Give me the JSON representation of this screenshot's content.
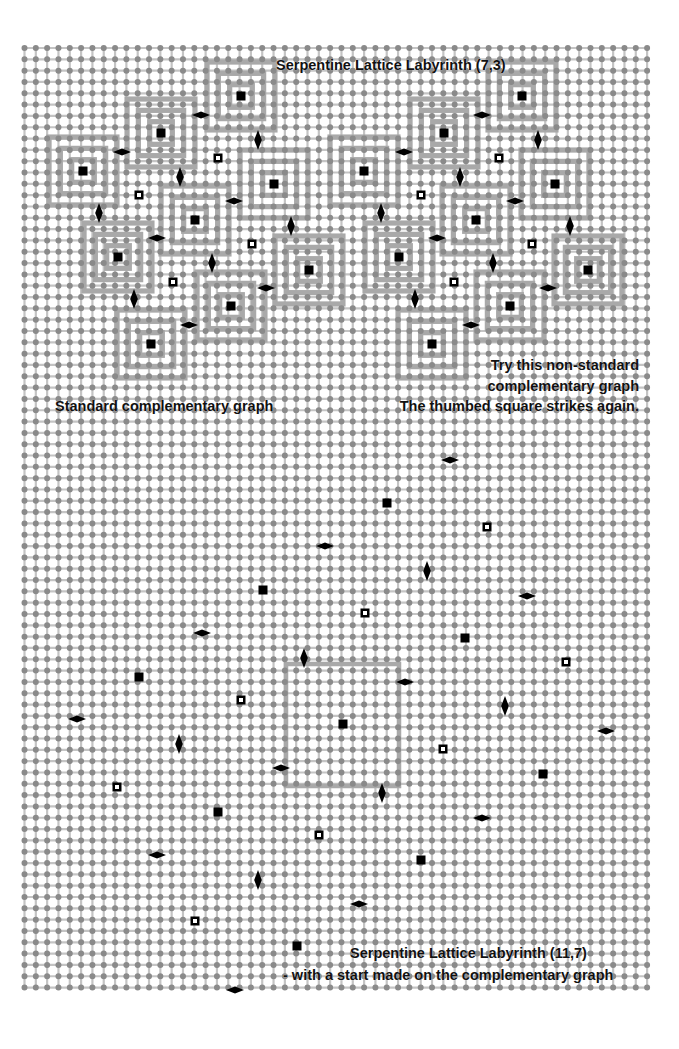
{
  "grid": {
    "origin_x": 24.5,
    "origin_y": 48,
    "spacing": 11.32,
    "cols": 56,
    "rows": 84,
    "dot_color": "#8a8a8a",
    "line_color": "#c4c4c4",
    "wall_color": "#a9a9a9",
    "marker_color": "#000000"
  },
  "labels": {
    "top_title": "Serpentine Lattice Labyrinth (7,3)",
    "left_caption": "Standard complementary graph",
    "right_caption_1": "Try this non-standard",
    "right_caption_2": "complementary graph",
    "right_caption_3": "The thumbed square strikes again.",
    "bottom_title": "Serpentine Lattice Labyrinth (11,7)",
    "bottom_subtitle": "- with a start made on the complementary graph"
  },
  "top_left_maze": {
    "centers": [
      [
        241,
        96
      ],
      [
        161,
        133
      ],
      [
        83,
        171
      ],
      [
        274,
        184
      ],
      [
        195,
        220
      ],
      [
        118,
        257
      ],
      [
        309,
        270
      ],
      [
        231,
        306
      ],
      [
        151,
        344
      ]
    ],
    "hollow": [
      [
        218,
        158
      ],
      [
        139,
        195
      ],
      [
        252,
        244
      ],
      [
        173,
        282
      ]
    ],
    "h_diamonds": [
      [
        201,
        115
      ],
      [
        122,
        152
      ],
      [
        234,
        201
      ],
      [
        157,
        238
      ],
      [
        266,
        288
      ],
      [
        189,
        325
      ]
    ],
    "v_diamonds": [
      [
        258,
        140
      ],
      [
        180,
        177
      ],
      [
        99,
        213
      ],
      [
        291,
        226
      ],
      [
        212,
        263
      ],
      [
        134,
        299
      ]
    ]
  },
  "top_right_maze": {
    "centers": [
      [
        522,
        96
      ],
      [
        444,
        133
      ],
      [
        364,
        171
      ],
      [
        555,
        184
      ],
      [
        476,
        220
      ],
      [
        399,
        257
      ],
      [
        588,
        270
      ],
      [
        510,
        306
      ],
      [
        432,
        344
      ]
    ],
    "hollow": [
      [
        499,
        158
      ],
      [
        421,
        195
      ],
      [
        532,
        244
      ],
      [
        454,
        282
      ]
    ],
    "h_diamonds": [
      [
        482,
        115
      ],
      [
        404,
        152
      ],
      [
        515,
        201
      ],
      [
        437,
        238
      ],
      [
        548,
        288
      ],
      [
        471,
        325
      ]
    ],
    "v_diamonds": [
      [
        538,
        140
      ],
      [
        460,
        177
      ],
      [
        381,
        213
      ],
      [
        570,
        226
      ],
      [
        493,
        263
      ],
      [
        415,
        299
      ]
    ]
  },
  "bottom_section": {
    "square": {
      "x1": 286,
      "y1": 664,
      "x2": 399,
      "y2": 786
    },
    "centers": [
      [
        387,
        503
      ],
      [
        263,
        590
      ],
      [
        465,
        638
      ],
      [
        139,
        677
      ],
      [
        343,
        724
      ],
      [
        543,
        774
      ],
      [
        218,
        812
      ],
      [
        421,
        860
      ],
      [
        297,
        946
      ]
    ],
    "hollow": [
      [
        487,
        527
      ],
      [
        365,
        613
      ],
      [
        566,
        662
      ],
      [
        241,
        700
      ],
      [
        443,
        749
      ],
      [
        117,
        787
      ],
      [
        319,
        835
      ],
      [
        195,
        921
      ]
    ],
    "h_diamonds": [
      [
        450,
        460
      ],
      [
        325,
        546
      ],
      [
        527,
        596
      ],
      [
        202,
        633
      ],
      [
        405,
        682
      ],
      [
        77,
        719
      ],
      [
        606,
        731
      ],
      [
        281,
        768
      ],
      [
        482,
        818
      ],
      [
        157,
        855
      ],
      [
        359,
        904
      ],
      [
        235,
        990
      ]
    ],
    "v_diamonds": [
      [
        427,
        571
      ],
      [
        304,
        658
      ],
      [
        505,
        706
      ],
      [
        179,
        744
      ],
      [
        382,
        793
      ],
      [
        258,
        880
      ]
    ]
  }
}
